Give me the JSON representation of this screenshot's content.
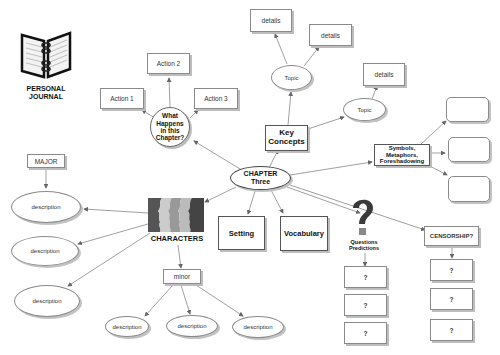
{
  "diagram": {
    "central": {
      "label": "CHAPTER Three"
    },
    "journal": {
      "label_line1": "PERSONAL",
      "label_line2": "JOURNAL",
      "icon": "notebook-icon"
    },
    "what_happens": {
      "label": "What Happens in this Chapter?",
      "actions": [
        "Action 1",
        "Action 2",
        "Action 3"
      ]
    },
    "key_concepts": {
      "label": "Key Concepts",
      "topics": [
        {
          "label": "Topic",
          "details": [
            "details",
            "details"
          ]
        },
        {
          "label": "Topic",
          "details": [
            "details"
          ]
        }
      ]
    },
    "symbols": {
      "label_line1": "Symbols,",
      "label_line2": "Metaphors,",
      "label_line3": "Foreshadowing",
      "blank_boxes": 3
    },
    "characters": {
      "label": "CHARACTERS",
      "icon": "faces-silhouette-icon",
      "major": {
        "label": "MAJOR",
        "descriptions": [
          "description",
          "description",
          "description"
        ]
      },
      "minor": {
        "label": "minor",
        "descriptions": [
          "description",
          "description",
          "description"
        ]
      }
    },
    "setting": {
      "label": "Setting"
    },
    "vocabulary": {
      "label": "Vocabulary"
    },
    "questions": {
      "label_line1": "Questions",
      "label_line2": "Predictions",
      "icon": "question-mark-icon",
      "items": [
        "?",
        "?",
        "?"
      ]
    },
    "censorship": {
      "label": "CENSORSHIP?",
      "items": [
        "?",
        "?",
        "?"
      ]
    },
    "colors": {
      "line": "#777777",
      "border": "#8a8a8a",
      "shadow": "#bdbdbd",
      "background": "#ffffff"
    }
  }
}
